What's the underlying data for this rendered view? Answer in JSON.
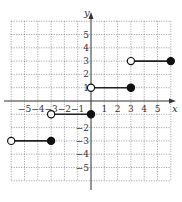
{
  "chart_data": {
    "type": "line",
    "title": "",
    "xlabel": "x",
    "ylabel": "y",
    "xlim": [
      -6,
      6
    ],
    "ylim": [
      -6,
      6
    ],
    "grid": true,
    "x_ticks": [
      -5,
      -4,
      -3,
      -2,
      -1,
      1,
      2,
      3,
      4,
      5
    ],
    "y_ticks": [
      -5,
      -4,
      -3,
      -2,
      1,
      2,
      3,
      4,
      5
    ],
    "series": [
      {
        "name": "segment-1",
        "x": [
          -6,
          -3
        ],
        "y": [
          -3,
          -3
        ],
        "start": "open",
        "end": "closed"
      },
      {
        "name": "segment-2",
        "x": [
          -3,
          0
        ],
        "y": [
          -1,
          -1
        ],
        "start": "open",
        "end": "closed"
      },
      {
        "name": "segment-3",
        "x": [
          0,
          3
        ],
        "y": [
          1,
          1
        ],
        "start": "open",
        "end": "closed"
      },
      {
        "name": "segment-4",
        "x": [
          3,
          6
        ],
        "y": [
          3,
          3
        ],
        "start": "open",
        "end": "closed"
      }
    ]
  },
  "labels": {
    "x_axis": "x",
    "y_axis": "y",
    "x_ticks": [
      "−5",
      "−4",
      "−3",
      "−2",
      "−1",
      "1",
      "2",
      "3",
      "4",
      "5"
    ],
    "y_ticks_pos": [
      "5",
      "4",
      "3",
      "2"
    ],
    "y_ticks_neg": [
      "−2",
      "−3",
      "−4",
      "−5"
    ]
  }
}
